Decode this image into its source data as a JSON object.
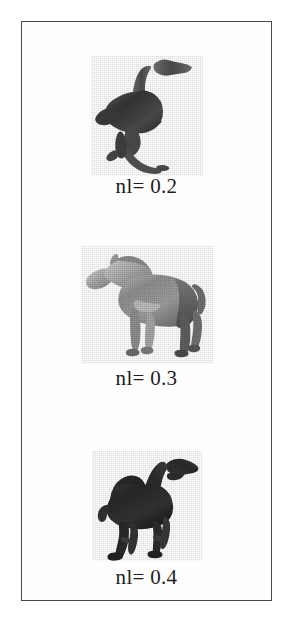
{
  "figure": {
    "kind": "image-grid-figure",
    "frame": {
      "border_color": "#4a4a4a",
      "background_color": "#fefefe",
      "page_background": "#ffffff"
    },
    "caption_prefix": "nl=",
    "panels": [
      {
        "id": "panel-ostrich",
        "subject": "ostrich",
        "subject_label": "ostrich silhouette",
        "caption": "nl= 0.2",
        "noise_level": "0.2",
        "fill_color": "#3a3a3a",
        "orientation": "head-up-right"
      },
      {
        "id": "panel-horse",
        "subject": "horse",
        "subject_label": "horse silhouette",
        "caption": "nl= 0.3",
        "noise_level": "0.3",
        "fill_color": "#8b8b8b",
        "orientation": "facing-left"
      },
      {
        "id": "panel-camel",
        "subject": "camel",
        "subject_label": "camel silhouette",
        "caption": "nl= 0.4",
        "noise_level": "0.4",
        "fill_color": "#2d2d2d",
        "orientation": "facing-right"
      }
    ]
  }
}
